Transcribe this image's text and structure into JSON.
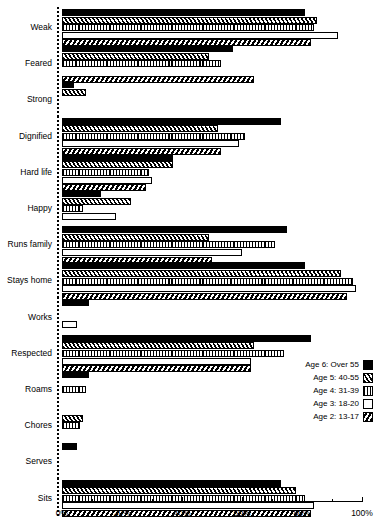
{
  "chart_data": {
    "type": "bar",
    "orientation": "horizontal",
    "title": "",
    "xlabel": "",
    "ylabel": "",
    "xlim": [
      0,
      100
    ],
    "xtick_labels": [
      "0%",
      "20%",
      "40%",
      "60%",
      "80%",
      "100%"
    ],
    "xtick_values": [
      0,
      20,
      40,
      60,
      80,
      100
    ],
    "xtick_minor_values": [
      10,
      30,
      50,
      70,
      90
    ],
    "grid": false,
    "legend_position": "middle-right",
    "categories": [
      "Weak",
      "Feared",
      "Strong",
      "Dignified",
      "Hard life",
      "Happy",
      "Runs family",
      "Stays home",
      "Works",
      "Respected",
      "Roams",
      "Chores",
      "Serves",
      "Sits"
    ],
    "series": [
      {
        "name": "Age 6: Over 55",
        "pattern": "solid",
        "values": [
          81,
          57,
          4,
          73,
          37,
          13,
          75,
          81,
          9,
          83,
          9,
          0,
          5,
          73
        ]
      },
      {
        "name": "Age 5: 40-55",
        "pattern": "diag",
        "values": [
          85,
          49,
          8,
          52,
          37,
          23,
          49,
          93,
          0,
          64,
          0,
          7,
          0,
          78
        ]
      },
      {
        "name": "Age 4: 31-39",
        "pattern": "vert",
        "values": [
          84,
          53,
          0,
          61,
          29,
          7,
          71,
          97,
          0,
          74,
          8,
          6,
          0,
          81
        ]
      },
      {
        "name": "Age 3: 18-20",
        "pattern": "white",
        "values": [
          92,
          0,
          0,
          59,
          30,
          18,
          60,
          98,
          5,
          63,
          0,
          0,
          0,
          84
        ]
      },
      {
        "name": "Age 2: 13-17",
        "pattern": "check",
        "values": [
          83,
          64,
          0,
          53,
          28,
          0,
          50,
          95,
          0,
          63,
          0,
          0,
          0,
          83
        ]
      }
    ]
  },
  "legend": {
    "entries": [
      {
        "label": "Age 6: Over 55",
        "pattern": "solid"
      },
      {
        "label": "Age 5: 40-55",
        "pattern": "diag"
      },
      {
        "label": "Age 4: 31-39",
        "pattern": "vert"
      },
      {
        "label": "Age 3: 18-20",
        "pattern": "white"
      },
      {
        "label": "Age 2: 13-17",
        "pattern": "check"
      }
    ]
  },
  "colors": {
    "foreground": "#000000",
    "background": "#ffffff"
  }
}
